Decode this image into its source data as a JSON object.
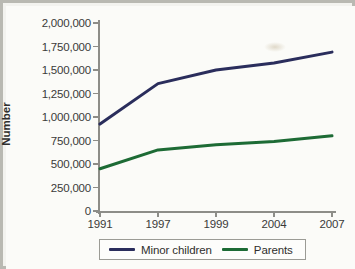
{
  "chart_data": {
    "type": "line",
    "title": "",
    "xlabel": "",
    "ylabel": "Number",
    "categories": [
      "1991",
      "1997",
      "1999",
      "2004",
      "2007"
    ],
    "ylim": [
      0,
      2000000
    ],
    "yticks": [
      0,
      250000,
      500000,
      750000,
      1000000,
      1250000,
      1500000,
      1750000,
      2000000
    ],
    "ytick_labels": [
      "0",
      "250,000",
      "500,000",
      "750,000",
      "1,000,000",
      "1,250,000",
      "1,500,000",
      "1,750,000",
      "2,000,000"
    ],
    "grid": false,
    "legend_position": "bottom",
    "series": [
      {
        "name": "Minor children",
        "color": "#2a2d5c",
        "values": [
          925000,
          1355000,
          1500000,
          1575000,
          1690000
        ]
      },
      {
        "name": "Parents",
        "color": "#1d6b35",
        "values": [
          450000,
          650000,
          705000,
          740000,
          800000
        ]
      }
    ]
  },
  "axis": {
    "y_title": "Number"
  },
  "legend": {
    "items": [
      {
        "label": "Minor children",
        "color": "#2a2d5c"
      },
      {
        "label": "Parents",
        "color": "#1d6b35"
      }
    ]
  }
}
